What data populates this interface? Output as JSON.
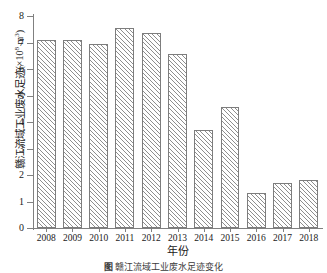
{
  "chart_data": {
    "type": "bar",
    "title": "",
    "xlabel": "年份",
    "ylabel": "赣江流域工业废水足迹(×10⁸ m³)",
    "ylabel_text": "赣江流域工业废水足迹",
    "ylabel_unit_prefix": "(×10",
    "ylabel_unit_exp": "8",
    "ylabel_unit_suffix": " m",
    "ylabel_unit_exp2": "3",
    "ylabel_unit_close": ")",
    "categories": [
      "2008",
      "2009",
      "2010",
      "2011",
      "2012",
      "2013",
      "2014",
      "2015",
      "2016",
      "2017",
      "2018"
    ],
    "values": [
      7.08,
      7.11,
      6.95,
      7.55,
      7.37,
      6.55,
      3.7,
      4.58,
      1.34,
      1.68,
      1.83
    ],
    "ylim": [
      0,
      8
    ],
    "yticks": [
      0,
      1,
      2,
      3,
      4,
      5,
      6,
      7,
      8
    ],
    "ytick_labels": [
      "0",
      "1",
      "2",
      "3",
      "4",
      "5",
      "6",
      "7",
      "8"
    ],
    "grid": false,
    "legend": false,
    "bar_fill": "#ffffff",
    "bar_hatch": "diagonal-forward-slash",
    "bar_hatch_color": "#8e8e8e",
    "bar_edge_color": "#7d7d7d",
    "axis_color": "#808080"
  },
  "caption": {
    "tag": "图",
    "text": "赣江流域工业废水足迹变化"
  }
}
